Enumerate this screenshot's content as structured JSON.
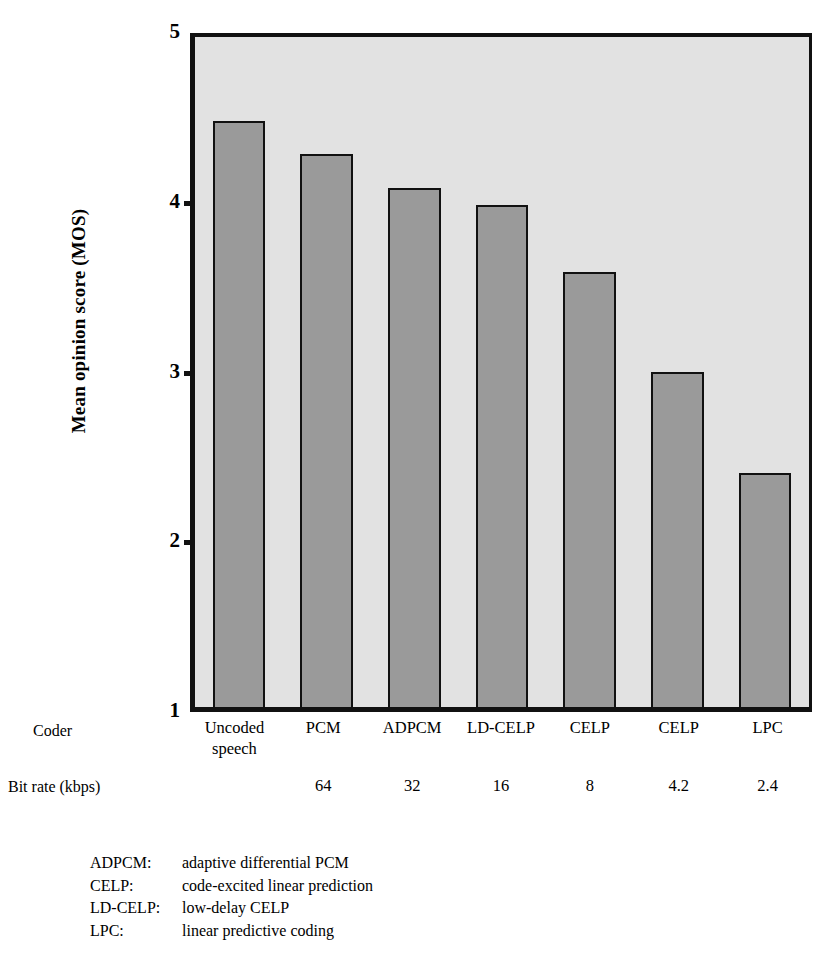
{
  "chart_data": {
    "type": "bar",
    "title": "",
    "xlabel": "Coder",
    "ylabel": "Mean opinion score (MOS)",
    "ylim": [
      1,
      5
    ],
    "yticks": [
      5,
      4,
      3,
      2,
      1
    ],
    "ytick_labels": [
      "5",
      "4",
      "3",
      "2",
      "1"
    ],
    "grid": false,
    "legend_position": "below-axes",
    "categories": [
      "Uncoded speech",
      "PCM",
      "ADPCM",
      "LD-CELP",
      "CELP",
      "CELP",
      "LPC"
    ],
    "category_lines": [
      [
        "Uncoded",
        "speech"
      ],
      [
        "PCM"
      ],
      [
        "ADPCM"
      ],
      [
        "LD-CELP"
      ],
      [
        "CELP"
      ],
      [
        "CELP"
      ],
      [
        "LPC"
      ]
    ],
    "values": [
      4.5,
      4.3,
      4.1,
      4.0,
      3.6,
      3.0,
      2.4
    ],
    "secondary_axis_label": "Bit rate (kbps)",
    "bit_rates": [
      "",
      "64",
      "32",
      "16",
      "8",
      "4.2",
      "2.4"
    ],
    "bar_fill_color": "#9a9a9a",
    "bar_edge_color": "#111111",
    "plot_background_color": "#e2e2e2"
  },
  "axis": {
    "y_title": "Mean opinion score (MOS)",
    "ticks": [
      {
        "label": "5",
        "value": 5
      },
      {
        "label": "4",
        "value": 4
      },
      {
        "label": "3",
        "value": 3
      },
      {
        "label": "2",
        "value": 2
      },
      {
        "label": "1",
        "value": 1
      }
    ]
  },
  "rows": {
    "coder_label": "Coder",
    "bitrate_label": "Bit rate (kbps)"
  },
  "legend": {
    "entries": [
      {
        "abbr": "ADPCM:",
        "desc": "adaptive differential PCM"
      },
      {
        "abbr": "CELP:",
        "desc": "code-excited linear prediction"
      },
      {
        "abbr": "LD-CELP:",
        "desc": "low-delay CELP"
      },
      {
        "abbr": "LPC:",
        "desc": "linear predictive coding"
      }
    ]
  }
}
